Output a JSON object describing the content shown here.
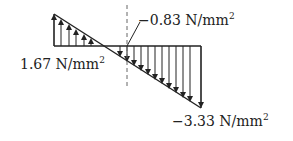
{
  "diagram": {
    "type": "linear stress distribution",
    "labels": {
      "left": {
        "value": "1.67 N/mm",
        "exp": "2"
      },
      "middle": {
        "value": "−0.83 N/mm",
        "exp": "2"
      },
      "right": {
        "value": "−3.33 N/mm",
        "exp": "2"
      }
    },
    "colors": {
      "line": "#222222",
      "dashed": "#666666"
    }
  }
}
